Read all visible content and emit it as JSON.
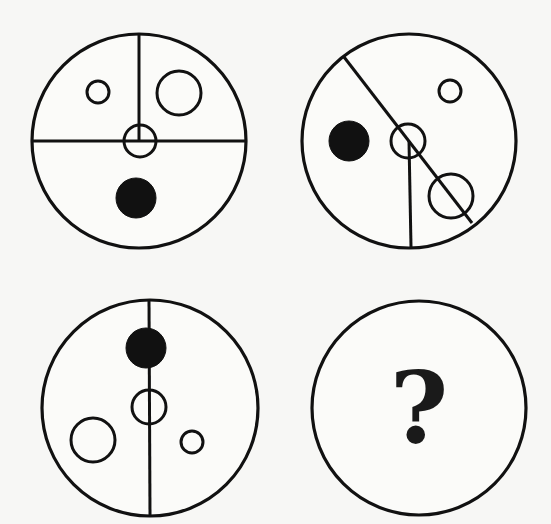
{
  "puzzle": {
    "panels": [
      {
        "id": "panel-1",
        "outer": {
          "cx": 139,
          "cy": 141,
          "r": 107
        },
        "lines": [
          {
            "x1": 139,
            "y1": 34,
            "x2": 139,
            "y2": 141
          },
          {
            "x1": 32,
            "y1": 141,
            "x2": 246,
            "y2": 141
          }
        ],
        "open_circles": [
          {
            "cx": 98,
            "cy": 92,
            "r": 11
          },
          {
            "cx": 179,
            "cy": 93,
            "r": 22
          },
          {
            "cx": 140,
            "cy": 141,
            "r": 16
          }
        ],
        "filled_circles": [
          {
            "cx": 136,
            "cy": 198,
            "r": 20
          }
        ]
      },
      {
        "id": "panel-2",
        "outer": {
          "cx": 409,
          "cy": 141,
          "r": 107
        },
        "lines": [
          {
            "x1": 344,
            "y1": 57,
            "x2": 472,
            "y2": 223
          },
          {
            "x1": 409,
            "y1": 141,
            "x2": 411,
            "y2": 247
          }
        ],
        "open_circles": [
          {
            "cx": 450,
            "cy": 91,
            "r": 11
          },
          {
            "cx": 408,
            "cy": 141,
            "r": 17
          },
          {
            "cx": 451,
            "cy": 196,
            "r": 22
          }
        ],
        "filled_circles": [
          {
            "cx": 349,
            "cy": 141,
            "r": 20
          }
        ]
      },
      {
        "id": "panel-3",
        "outer": {
          "cx": 150,
          "cy": 408,
          "r": 108
        },
        "lines": [
          {
            "x1": 149,
            "y1": 300,
            "x2": 150,
            "y2": 516
          }
        ],
        "open_circles": [
          {
            "cx": 149,
            "cy": 407,
            "r": 17
          },
          {
            "cx": 93,
            "cy": 440,
            "r": 22
          },
          {
            "cx": 192,
            "cy": 442,
            "r": 11
          }
        ],
        "filled_circles": [
          {
            "cx": 146,
            "cy": 348,
            "r": 20
          }
        ]
      },
      {
        "id": "panel-4",
        "outer": {
          "cx": 419,
          "cy": 408,
          "r": 107
        },
        "lines": [],
        "open_circles": [],
        "filled_circles": [],
        "label": "?"
      }
    ]
  }
}
